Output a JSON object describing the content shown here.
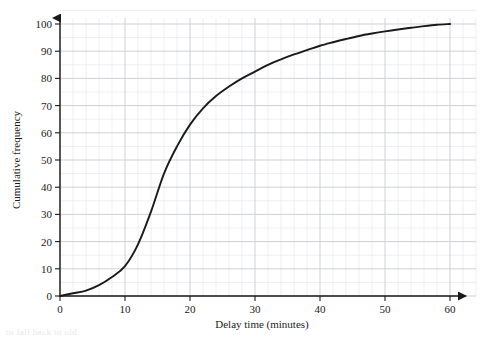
{
  "chart_data": {
    "type": "line",
    "title": "",
    "xlabel": "Delay time (minutes)",
    "ylabel": "Cumulative frequency",
    "xlim": [
      0,
      60
    ],
    "ylim": [
      0,
      100
    ],
    "xticks": [
      0,
      10,
      20,
      30,
      40,
      50,
      60
    ],
    "yticks": [
      0,
      10,
      20,
      30,
      40,
      50,
      60,
      70,
      80,
      90,
      100
    ],
    "xtick_labels": [
      "0",
      "10",
      "20",
      "30",
      "40",
      "50",
      "60"
    ],
    "ytick_labels": [
      "0",
      "10",
      "20",
      "30",
      "40",
      "50",
      "60",
      "70",
      "80",
      "90",
      "100"
    ],
    "grid": true,
    "grid_minor_x_step": 2,
    "grid_minor_y_step": 5,
    "legend": "none",
    "series": [
      {
        "name": "Cumulative frequency",
        "x": [
          0,
          2,
          4,
          6,
          8,
          10,
          12,
          14,
          16,
          18,
          20,
          22,
          24,
          26,
          28,
          30,
          32,
          34,
          36,
          38,
          40,
          42,
          44,
          46,
          48,
          50,
          52,
          54,
          56,
          58,
          60
        ],
        "values": [
          0,
          1,
          2,
          4,
          7,
          11,
          19,
          31,
          45,
          55,
          63,
          69,
          73.5,
          77,
          80,
          82.5,
          85,
          87,
          88.8,
          90.4,
          92,
          93.3,
          94.5,
          95.6,
          96.5,
          97.3,
          98,
          98.6,
          99.2,
          99.7,
          100
        ]
      }
    ]
  },
  "axes": {
    "x_arrow": "arrow-right",
    "y_arrow": "arrow-up"
  },
  "colors": {
    "curve": "#1a1a1a",
    "axis": "#1a1a1a",
    "grid_major": "#c9ccd4",
    "grid_minor": "#e6e8ec",
    "background": "#ffffff"
  },
  "footer": {
    "fragment": "to fall back to old"
  }
}
